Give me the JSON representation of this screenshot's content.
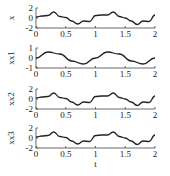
{
  "chart_data": [
    {
      "type": "line",
      "ylabel": "x",
      "xlabel": "",
      "xlim": [
        0,
        2
      ],
      "ylim": [
        -2,
        2
      ],
      "yticks": [
        "2",
        "0",
        "-2"
      ],
      "xticks": [
        "0",
        "0.5",
        "1",
        "1.5",
        "2"
      ],
      "x": [
        0,
        0.1,
        0.2,
        0.3,
        0.4,
        0.5,
        0.6,
        0.7,
        0.8,
        0.9,
        1.0,
        1.1,
        1.2,
        1.3,
        1.4,
        1.5,
        1.6,
        1.7,
        1.8,
        1.9,
        2.0
      ],
      "values": [
        0.2,
        0.4,
        0.5,
        1.2,
        0.3,
        0.1,
        -0.6,
        -1.2,
        -0.6,
        -0.7,
        0.5,
        0.6,
        0.6,
        1.2,
        0.3,
        0.0,
        -0.6,
        -1.3,
        -0.6,
        -0.7,
        0.6
      ]
    },
    {
      "type": "line",
      "ylabel": "xx1",
      "xlabel": "",
      "xlim": [
        0,
        2
      ],
      "ylim": [
        -1,
        1
      ],
      "yticks": [
        "1",
        "0",
        "-1"
      ],
      "xticks": [
        "0",
        "0.5",
        "1",
        "1.5",
        "2"
      ],
      "x": [
        0,
        0.2,
        0.4,
        0.6,
        0.8,
        1.0,
        1.2,
        1.4,
        1.6,
        1.8,
        2.0
      ],
      "values": [
        0.0,
        0.6,
        0.4,
        -0.3,
        -0.6,
        0.0,
        0.6,
        0.4,
        -0.3,
        -0.6,
        0.0
      ]
    },
    {
      "type": "line",
      "ylabel": "xx2",
      "xlabel": "",
      "xlim": [
        0,
        2
      ],
      "ylim": [
        -2,
        2
      ],
      "yticks": [
        "2",
        "0",
        "-2"
      ],
      "xticks": [
        "0",
        "0.5",
        "1",
        "1.5",
        "2"
      ],
      "x": [
        0,
        0.1,
        0.2,
        0.3,
        0.4,
        0.5,
        0.6,
        0.7,
        0.8,
        0.9,
        1.0,
        1.1,
        1.2,
        1.3,
        1.4,
        1.5,
        1.6,
        1.7,
        1.8,
        1.9,
        2.0
      ],
      "values": [
        0.2,
        0.4,
        0.5,
        1.2,
        0.3,
        0.1,
        -0.6,
        -1.2,
        -0.6,
        -0.7,
        0.5,
        0.6,
        0.6,
        1.2,
        0.3,
        0.0,
        -0.6,
        -1.3,
        -0.6,
        -0.7,
        0.6
      ]
    },
    {
      "type": "line",
      "ylabel": "xx3",
      "xlabel": "t",
      "xlim": [
        0,
        2
      ],
      "ylim": [
        -2,
        2
      ],
      "yticks": [
        "2",
        "0",
        "-2"
      ],
      "xticks": [
        "0",
        "0.5",
        "1",
        "1.5",
        "2"
      ],
      "x": [
        0,
        0.1,
        0.2,
        0.3,
        0.4,
        0.5,
        0.6,
        0.7,
        0.8,
        0.9,
        1.0,
        1.1,
        1.2,
        1.3,
        1.4,
        1.5,
        1.6,
        1.7,
        1.8,
        1.9,
        2.0
      ],
      "values": [
        0.2,
        0.4,
        0.5,
        1.2,
        0.3,
        0.1,
        -0.6,
        -1.2,
        -0.6,
        -0.7,
        0.5,
        0.6,
        0.6,
        1.2,
        0.3,
        0.0,
        -0.6,
        -1.3,
        -0.6,
        -0.7,
        0.6
      ]
    }
  ],
  "labels": {
    "panel0_ylabel": "x",
    "panel1_ylabel": "xx1",
    "panel2_ylabel": "xx2",
    "panel3_ylabel": "xx3",
    "xlabel": "t"
  },
  "colors": {
    "line": "#222222",
    "axis": "#444444",
    "background": "#ffffff"
  }
}
